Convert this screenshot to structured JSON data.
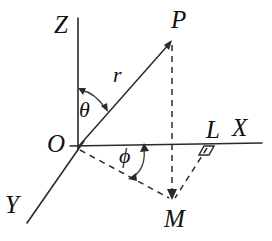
{
  "diagram": {
    "type": "geometry-diagram",
    "background_color": "#ffffff",
    "stroke_color": "#2b2b2b",
    "label_color": "#111111",
    "labels": {
      "z_axis": "Z",
      "x_axis": "X",
      "y_axis": "Y",
      "point_p": "P",
      "point_o": "O",
      "point_m": "M",
      "point_l": "L",
      "radius": "r",
      "polar_angle": "θ",
      "azimuth_angle": "ϕ"
    },
    "geometry": {
      "origin": {
        "x": 78,
        "y": 147
      },
      "z_axis_top": {
        "x": 78,
        "y": 18
      },
      "x_axis_end": {
        "x": 262,
        "y": 143
      },
      "y_axis_end": {
        "x": 27,
        "y": 223
      },
      "point_p": {
        "x": 172,
        "y": 40
      },
      "point_m": {
        "x": 172,
        "y": 199
      },
      "point_l": {
        "x": 207,
        "y": 145
      },
      "radius_segment": "O to P",
      "dashed_segments": [
        "P to M",
        "O to M",
        "L to M"
      ],
      "right_angle_at": "L",
      "polar_angle_between": "Z axis and OP",
      "azimuth_angle_between": "X axis and OM"
    }
  }
}
